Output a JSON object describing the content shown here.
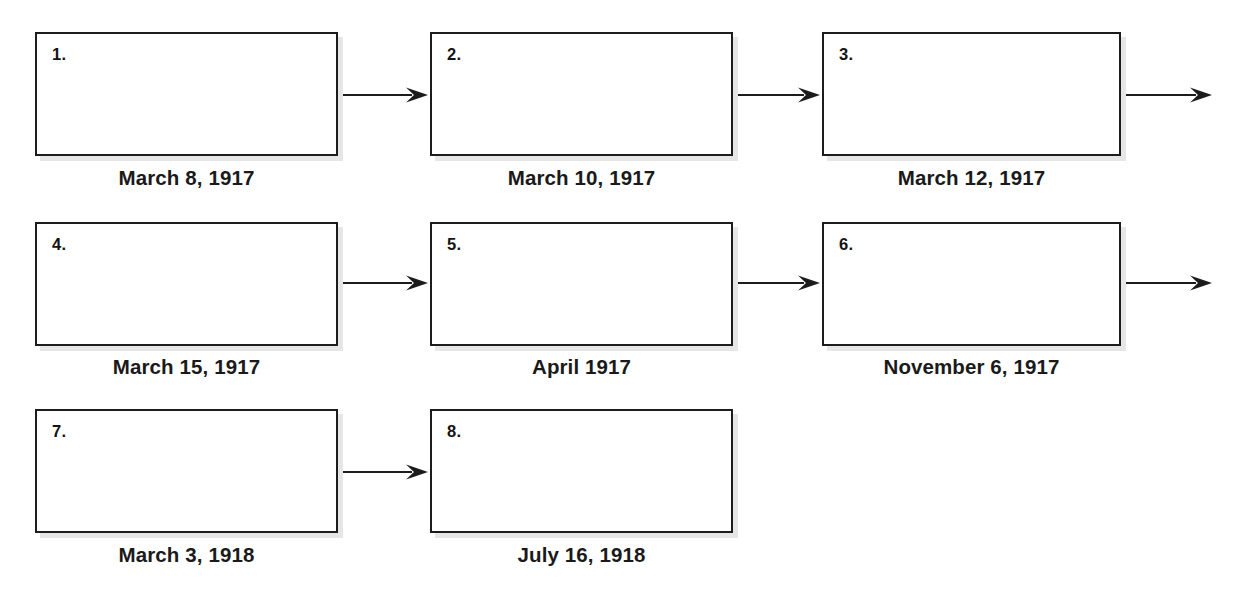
{
  "diagram": {
    "type": "flowchart-timeline",
    "orientation": "left-to-right, wrapped into rows",
    "box_fill": "#ffffff",
    "box_border_color": "#1c1c1c",
    "shadow_color": "#e6e6e6",
    "arrow_color": "#1c1c1c",
    "text_color": "#1a1a1a",
    "rows": [
      {
        "row_index": 0,
        "box_top": 32,
        "arrow_y": 95,
        "caption_top": 168,
        "trailing_arrow": true,
        "nodes": [
          {
            "number": "1.",
            "caption": "March 8, 1917",
            "left": 35,
            "width": 303,
            "height": 124,
            "content": ""
          },
          {
            "number": "2.",
            "caption": "March 10, 1917",
            "left": 430,
            "width": 303,
            "height": 124,
            "content": ""
          },
          {
            "number": "3.",
            "caption": "March 12, 1917",
            "left": 822,
            "width": 299,
            "height": 124,
            "content": ""
          }
        ]
      },
      {
        "row_index": 1,
        "box_top": 222,
        "arrow_y": 283,
        "caption_top": 357,
        "trailing_arrow": true,
        "nodes": [
          {
            "number": "4.",
            "caption": "March 15, 1917",
            "left": 35,
            "width": 303,
            "height": 124,
            "content": ""
          },
          {
            "number": "5.",
            "caption": "April 1917",
            "left": 430,
            "width": 303,
            "height": 124,
            "content": ""
          },
          {
            "number": "6.",
            "caption": "November 6, 1917",
            "left": 822,
            "width": 299,
            "height": 124,
            "content": ""
          }
        ]
      },
      {
        "row_index": 2,
        "box_top": 409,
        "arrow_y": 472,
        "caption_top": 545,
        "trailing_arrow": false,
        "nodes": [
          {
            "number": "7.",
            "caption": "March 3, 1918",
            "left": 35,
            "width": 303,
            "height": 124,
            "content": ""
          },
          {
            "number": "8.",
            "caption": "July 16, 1918",
            "left": 430,
            "width": 303,
            "height": 124,
            "content": ""
          }
        ]
      }
    ],
    "arrows": [
      {
        "id": "arrow-1-to-2",
        "x1": 338,
        "x2": 428,
        "y": 95,
        "head": true
      },
      {
        "id": "arrow-2-to-3",
        "x1": 733,
        "x2": 820,
        "y": 95,
        "head": true
      },
      {
        "id": "arrow-3-out",
        "x1": 1121,
        "x2": 1212,
        "y": 95,
        "head": true
      },
      {
        "id": "arrow-4-to-5",
        "x1": 338,
        "x2": 428,
        "y": 283,
        "head": true
      },
      {
        "id": "arrow-5-to-6",
        "x1": 733,
        "x2": 820,
        "y": 283,
        "head": true
      },
      {
        "id": "arrow-6-out",
        "x1": 1121,
        "x2": 1212,
        "y": 283,
        "head": true
      },
      {
        "id": "arrow-7-to-8",
        "x1": 338,
        "x2": 428,
        "y": 472,
        "head": true
      }
    ]
  }
}
